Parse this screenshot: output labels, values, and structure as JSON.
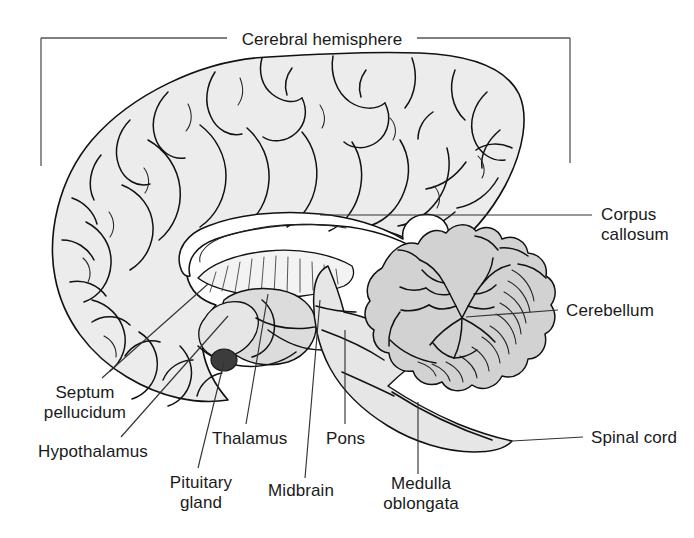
{
  "figure": {
    "kind": "anatomical-diagram",
    "background_color": "#ffffff",
    "line_color": "#111111"
  },
  "palette": {
    "cerebrum_fill": "#ececec",
    "cerebellum_fill": "#d0d0d0",
    "cerebellum_shade": "#bdbdbd",
    "brainstem_fill": "#e4e4e4",
    "thalamus_fill": "#dcdcdc",
    "corpus_callosum_fill": "#ffffff",
    "pituitary_fill": "#3c3c3c",
    "leader_color": "#333333",
    "text_color": "#1a1a1a"
  },
  "header": {
    "bracket_label": "Cerebral hemisphere"
  },
  "labels": {
    "cerebral_hemisphere": "Cerebral hemisphere",
    "corpus_callosum_line1": "Corpus",
    "corpus_callosum_line2": "callosum",
    "cerebellum": "Cerebellum",
    "spinal_cord": "Spinal cord",
    "septum_line1": "Septum",
    "septum_line2": "pellucidum",
    "hypothalamus": "Hypothalamus",
    "pituitary_line1": "Pituitary",
    "pituitary_line2": "gland",
    "thalamus": "Thalamus",
    "midbrain": "Midbrain",
    "pons": "Pons",
    "medulla_line1": "Medulla",
    "medulla_line2": "oblongata"
  },
  "parts": [
    {
      "id": "cerebral-hemisphere",
      "name": "Cerebral hemisphere",
      "label_position": "top-center",
      "leader": "bracket"
    },
    {
      "id": "corpus-callosum",
      "name": "Corpus callosum",
      "label_position": "right",
      "leader": "horizontal"
    },
    {
      "id": "cerebellum",
      "name": "Cerebellum",
      "label_position": "right",
      "leader": "horizontal"
    },
    {
      "id": "spinal-cord",
      "name": "Spinal cord",
      "label_position": "right",
      "leader": "horizontal"
    },
    {
      "id": "septum-pellucidum",
      "name": "Septum pellucidum",
      "label_position": "bottom-left",
      "leader": "diagonal"
    },
    {
      "id": "hypothalamus",
      "name": "Hypothalamus",
      "label_position": "bottom-left",
      "leader": "diagonal"
    },
    {
      "id": "pituitary-gland",
      "name": "Pituitary gland",
      "label_position": "bottom",
      "leader": "diagonal"
    },
    {
      "id": "thalamus",
      "name": "Thalamus",
      "label_position": "bottom",
      "leader": "diagonal"
    },
    {
      "id": "midbrain",
      "name": "Midbrain",
      "label_position": "bottom",
      "leader": "vertical"
    },
    {
      "id": "pons",
      "name": "Pons",
      "label_position": "bottom",
      "leader": "vertical"
    },
    {
      "id": "medulla-oblongata",
      "name": "Medulla oblongata",
      "label_position": "bottom",
      "leader": "vertical"
    }
  ]
}
